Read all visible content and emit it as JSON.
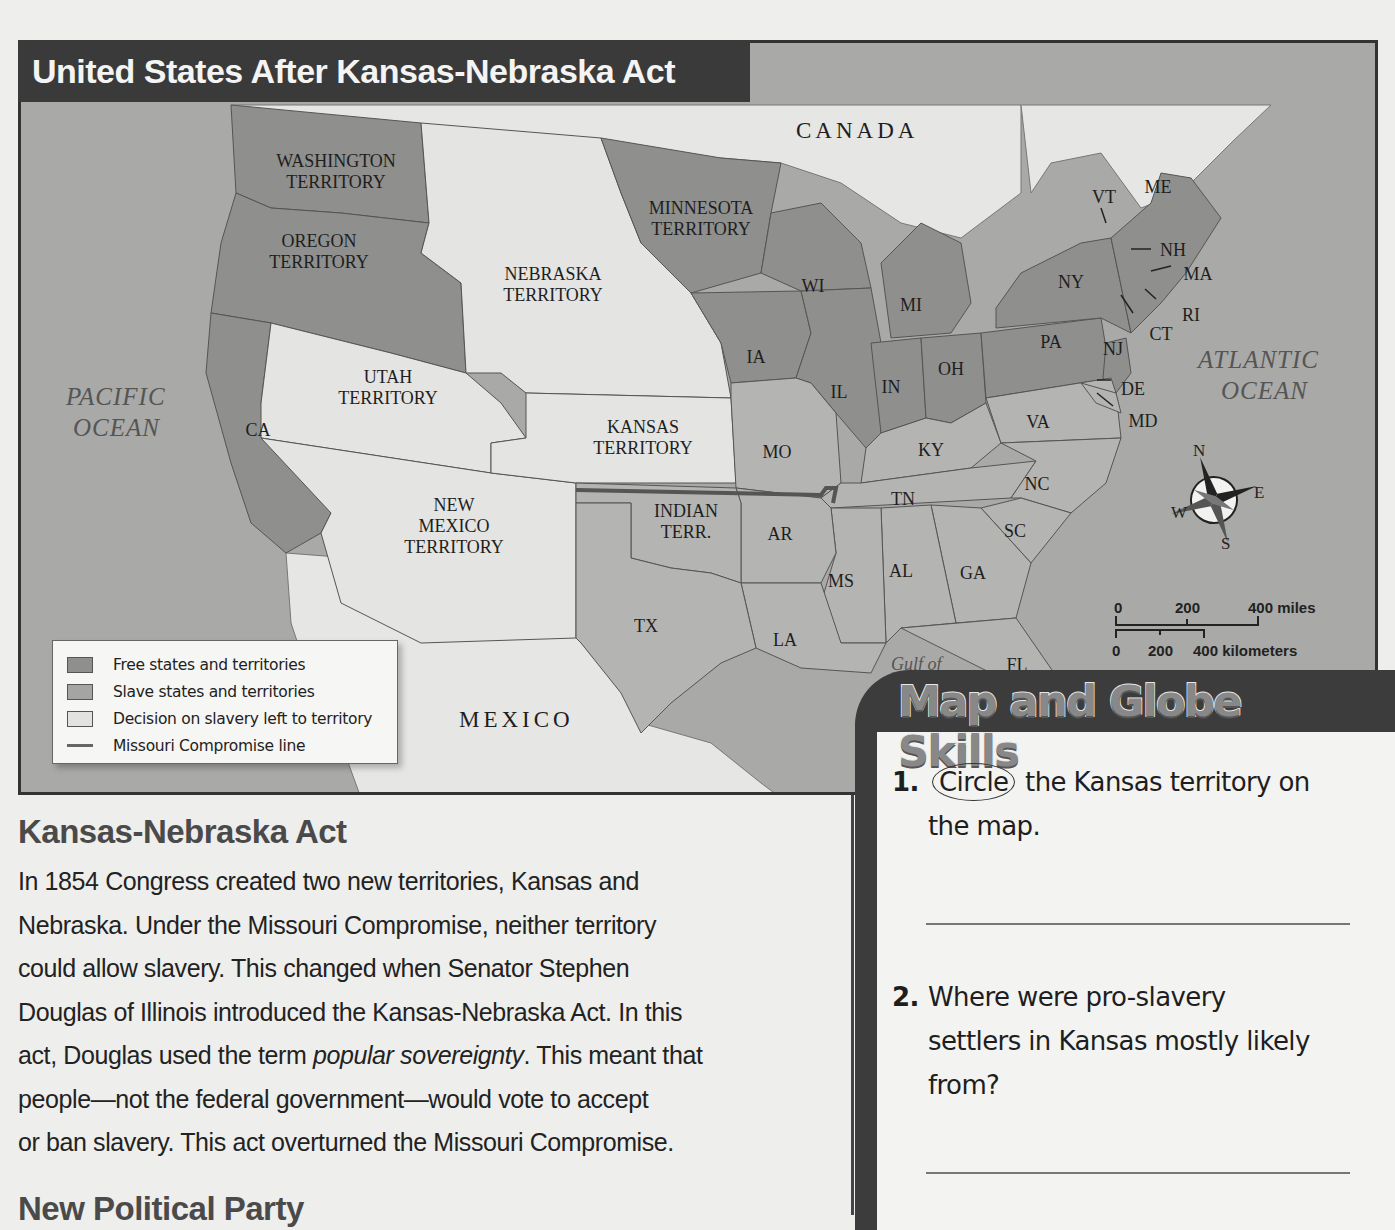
{
  "map": {
    "title": "United States After Kansas-Nebraska Act",
    "regions": {
      "canada": "CANADA",
      "mexico": "MEXICO",
      "pacific_ocean": [
        "PACIFIC",
        "OCEAN"
      ],
      "atlantic_ocean": [
        "ATLANTIC",
        "OCEAN"
      ],
      "gulf": "Gulf of"
    },
    "territories": {
      "washington": [
        "WASHINGTON",
        "TERRITORY"
      ],
      "oregon": [
        "OREGON",
        "TERRITORY"
      ],
      "minnesota": [
        "MINNESOTA",
        "TERRITORY"
      ],
      "nebraska": [
        "NEBRASKA",
        "TERRITORY"
      ],
      "utah": [
        "UTAH",
        "TERRITORY"
      ],
      "kansas": [
        "KANSAS",
        "TERRITORY"
      ],
      "new_mexico": [
        "NEW",
        "MEXICO",
        "TERRITORY"
      ],
      "indian": [
        "INDIAN",
        "TERR."
      ]
    },
    "states": [
      "CA",
      "WI",
      "MI",
      "IA",
      "IL",
      "IN",
      "OH",
      "PA",
      "NY",
      "VT",
      "ME",
      "NH",
      "MA",
      "RI",
      "CT",
      "NJ",
      "DE",
      "MD",
      "VA",
      "KY",
      "MO",
      "TN",
      "NC",
      "SC",
      "GA",
      "AL",
      "MS",
      "AR",
      "LA",
      "TX",
      "FL"
    ],
    "compass": {
      "n": "N",
      "e": "E",
      "s": "S",
      "w": "W"
    },
    "scale": {
      "miles": [
        "0",
        "200",
        "400 miles"
      ],
      "km": [
        "0",
        "200",
        "400 kilometers"
      ]
    },
    "legend": [
      {
        "label": "Free states and territories",
        "color": "#8f8f8d",
        "type": "box"
      },
      {
        "label": "Slave states and territories",
        "color": "#a5a5a3",
        "type": "box"
      },
      {
        "label": "Decision on slavery left to territory",
        "color": "#e2e2e0",
        "type": "box"
      },
      {
        "label": "Missouri Compromise line",
        "color": "#666666",
        "type": "line"
      }
    ],
    "colors": {
      "free": "#8f8f8d",
      "slave": "#b4b4b2",
      "open": "#e4e4e2",
      "ocean": "#a9a9a7",
      "foreign": "#e6e6e4"
    }
  },
  "article": {
    "heading": "Kansas-Nebraska Act",
    "lines": [
      "In 1854 Congress created two new territories, Kansas and",
      "Nebraska. Under the Missouri Compromise, neither territory",
      "could allow slavery. This changed when Senator Stephen",
      "Douglas of Illinois introduced the Kansas-Nebraska Act. In this"
    ],
    "line5_before": "act, Douglas used the term ",
    "line5_italic": "popular sovereignty",
    "line5_after": ". This meant that",
    "lines_end": [
      "people—not the federal government—would vote to accept",
      "or ban slavery. This act overturned the Missouri Compromise."
    ],
    "next_heading": "New Political Party"
  },
  "skills": {
    "title": "Map and Globe Skills",
    "q1": {
      "number": "1.",
      "circled_word": "Circle",
      "rest_line1": " the Kansas territory on",
      "line2": "the map."
    },
    "q2": {
      "number": "2.",
      "line1": "Where were pro-slavery",
      "line2": "settlers in Kansas mostly likely",
      "line3": "from?"
    }
  }
}
